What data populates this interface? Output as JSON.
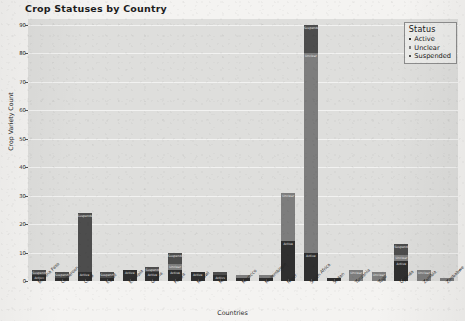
{
  "chart_data": {
    "type": "bar",
    "title": "Crop Statuses by Country",
    "xlabel": "Countries",
    "ylabel": "Crop Variety Count",
    "ylim": [
      0,
      92
    ],
    "yticks": [
      0,
      10,
      20,
      30,
      40,
      50,
      60,
      70,
      80,
      90
    ],
    "grid": true,
    "stacked": true,
    "legend": {
      "title": "Status",
      "position": "upper right",
      "entries": [
        {
          "label": "Active",
          "color": "#2f2f2f"
        },
        {
          "label": "Unclear",
          "color": "#7d7d7d"
        },
        {
          "label": "Suspended",
          "color": "#4d4d4d"
        }
      ]
    },
    "categories": [
      "Burkina Faso",
      "Cameroon",
      "Chad",
      "Egypt",
      "Ethiopia",
      "Ghana",
      "Kenya",
      "Malawi",
      "Mali",
      "Morocco",
      "Mozambique",
      "Niger",
      "South Africa",
      "Sudan",
      "Tanzania",
      "Togo",
      "Uganda",
      "Zambia",
      "Zimbabwe"
    ],
    "series": [
      {
        "name": "Active",
        "color": "#2f2f2f",
        "values": [
          2,
          1,
          3,
          1,
          4,
          3,
          4,
          3,
          2,
          1,
          1,
          14,
          10,
          1,
          0,
          0,
          7,
          0,
          0
        ]
      },
      {
        "name": "Unclear",
        "color": "#7d7d7d",
        "values": [
          0,
          0,
          0,
          0,
          0,
          0,
          2,
          0,
          0,
          1,
          1,
          17,
          70,
          0,
          4,
          3,
          2,
          4,
          1
        ]
      },
      {
        "name": "Suspended",
        "color": "#4d4d4d",
        "values": [
          2,
          2,
          21,
          2,
          0,
          2,
          4,
          0,
          1,
          0,
          0,
          0,
          10,
          0,
          0,
          0,
          4,
          0,
          0
        ]
      }
    ],
    "bar_labels": [
      [
        "Active",
        "Suspended"
      ],
      [
        "Suspended",
        "Active"
      ],
      [
        "Active",
        "Suspended"
      ],
      [
        "Suspended",
        "Active"
      ],
      [
        "Active"
      ],
      [
        "Active",
        "Suspended"
      ],
      [
        "Active",
        "Unclear",
        "Suspended"
      ],
      [
        "Active"
      ],
      [
        "Active",
        "Suspended"
      ],
      [
        "Unclear"
      ],
      [
        "Unclear"
      ],
      [
        "Active",
        "Unclear"
      ],
      [
        "Active",
        "Unclear",
        "Suspended"
      ],
      [
        "Active"
      ],
      [
        "Unclear"
      ],
      [
        "Unclear"
      ],
      [
        "Active",
        "Unclear",
        "Suspended"
      ],
      [
        "Unclear"
      ],
      [
        "Unclear"
      ]
    ]
  }
}
